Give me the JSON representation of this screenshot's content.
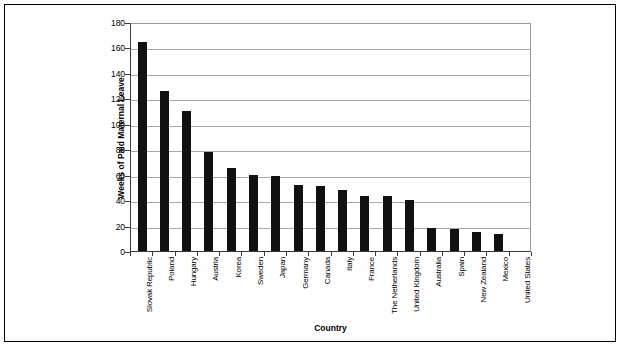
{
  "chart_data": {
    "type": "bar",
    "title": "",
    "xlabel": "Country",
    "ylabel": "Weeks of Paid Maternal Leave",
    "ylim": [
      0,
      180
    ],
    "yticks": [
      0,
      20,
      40,
      60,
      80,
      100,
      120,
      140,
      160,
      180
    ],
    "grid": true,
    "legend": "none",
    "bar_color": "#111111",
    "categories": [
      "Slovak Republic",
      "Poland",
      "Hungary",
      "Austria",
      "Korea",
      "Sweden",
      "Japan",
      "Germany",
      "Canada",
      "Italy",
      "France",
      "The Netherlands",
      "United Kingdom",
      "Australia",
      "Spain",
      "New Zealand",
      "Mexico",
      "United States"
    ],
    "values": [
      164,
      126,
      110,
      78,
      65,
      60,
      59,
      52,
      51,
      48,
      43,
      43,
      40,
      18,
      17,
      15,
      13,
      0
    ]
  }
}
